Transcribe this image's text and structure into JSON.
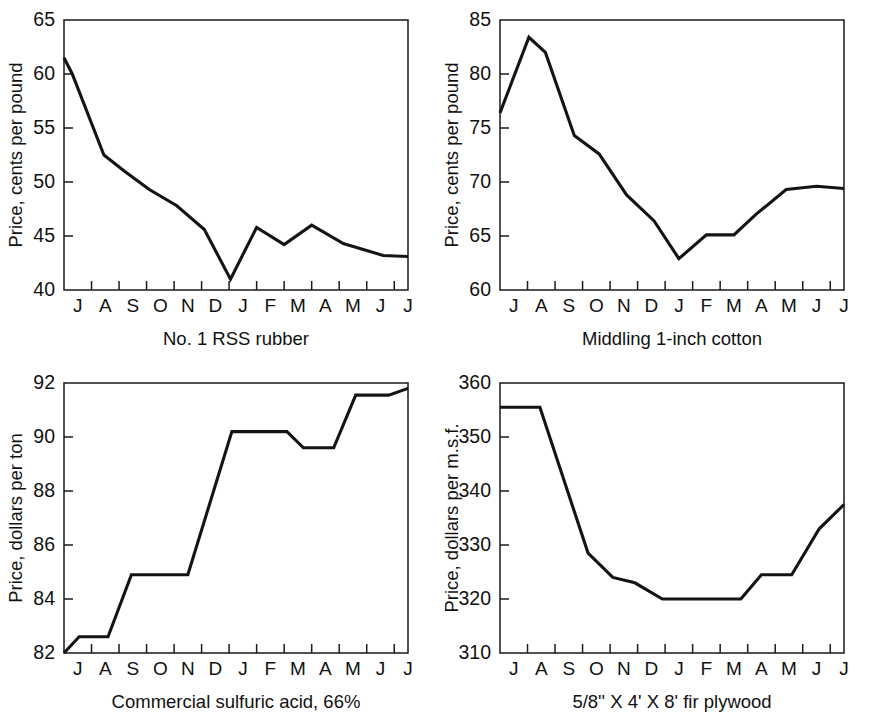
{
  "figure": {
    "panel_count": 4,
    "line_color": "#141414",
    "axis_color": "#1a1a1a",
    "background_color": "#ffffff"
  },
  "chart_data": [
    {
      "id": "rubber",
      "type": "line",
      "title": "",
      "caption": "No. 1 RSS rubber",
      "xlabel": "",
      "ylabel": "Price, cents per pound",
      "categories": [
        "J",
        "A",
        "S",
        "O",
        "N",
        "D",
        "J",
        "F",
        "M",
        "A",
        "M",
        "J",
        "J"
      ],
      "x_tick_labels": [
        "J",
        "A",
        "S",
        "O",
        "N",
        "D",
        "J",
        "F",
        "M",
        "A",
        "M",
        "J",
        "J"
      ],
      "y_tick_labels": [
        "40",
        "45",
        "50",
        "55",
        "60",
        "65"
      ],
      "y_ticks": [
        40,
        45,
        50,
        55,
        60,
        65
      ],
      "ylim": [
        40,
        65
      ],
      "values": [
        61.5,
        60.0,
        52.5,
        51.0,
        49.3,
        47.8,
        45.6,
        41.0,
        45.8,
        44.2,
        46.0,
        44.3,
        43.2,
        43.1
      ],
      "x_points": [
        0,
        0.3,
        1.45,
        2.2,
        3.1,
        4.1,
        5.1,
        6.05,
        7.0,
        8.0,
        9.0,
        10.15,
        11.6,
        12.5
      ],
      "grid": false,
      "legend": "none"
    },
    {
      "id": "cotton",
      "type": "line",
      "title": "",
      "caption": "Middling 1-inch cotton",
      "xlabel": "",
      "ylabel": "Price, cents per pound",
      "categories": [
        "J",
        "A",
        "S",
        "O",
        "N",
        "D",
        "J",
        "F",
        "M",
        "A",
        "M",
        "J",
        "J"
      ],
      "x_tick_labels": [
        "J",
        "A",
        "S",
        "O",
        "N",
        "D",
        "J",
        "F",
        "M",
        "A",
        "M",
        "J",
        "J"
      ],
      "y_tick_labels": [
        "60",
        "65",
        "70",
        "75",
        "80",
        "85"
      ],
      "y_ticks": [
        60,
        65,
        70,
        75,
        80,
        85
      ],
      "ylim": [
        60,
        85
      ],
      "values": [
        76.4,
        83.4,
        82.0,
        74.3,
        72.6,
        68.8,
        66.4,
        62.9,
        65.1,
        65.1,
        67.0,
        69.3,
        69.6,
        69.4
      ],
      "x_points": [
        0,
        1.05,
        1.65,
        2.7,
        3.6,
        4.6,
        5.6,
        6.5,
        7.5,
        8.5,
        9.3,
        10.4,
        11.5,
        12.5
      ],
      "grid": false,
      "legend": "none"
    },
    {
      "id": "sulfuric-acid",
      "type": "line",
      "title": "",
      "caption": "Commercial sulfuric acid, 66%",
      "xlabel": "",
      "ylabel": "Price, dollars per ton",
      "categories": [
        "J",
        "A",
        "S",
        "O",
        "N",
        "D",
        "J",
        "F",
        "M",
        "A",
        "M",
        "J",
        "J"
      ],
      "x_tick_labels": [
        "J",
        "A",
        "S",
        "O",
        "N",
        "D",
        "J",
        "F",
        "M",
        "A",
        "M",
        "J",
        "J"
      ],
      "y_tick_labels": [
        "82",
        "84",
        "86",
        "88",
        "90",
        "92"
      ],
      "y_ticks": [
        82,
        84,
        86,
        88,
        90,
        92
      ],
      "ylim": [
        82,
        92
      ],
      "values": [
        82.0,
        82.6,
        82.6,
        84.9,
        84.9,
        84.9,
        90.2,
        90.2,
        90.2,
        89.6,
        89.6,
        91.55,
        91.55,
        91.8
      ],
      "x_points": [
        0,
        0.55,
        1.6,
        2.45,
        4.0,
        4.5,
        6.1,
        7.0,
        8.1,
        8.7,
        9.8,
        10.6,
        11.8,
        12.5
      ],
      "grid": false,
      "legend": "none"
    },
    {
      "id": "fir-plywood",
      "type": "line",
      "title": "",
      "caption": "5/8'' X 4' X 8' fir plywood",
      "xlabel": "",
      "ylabel": "Price, dollars per m.s.f.",
      "categories": [
        "J",
        "A",
        "S",
        "O",
        "N",
        "D",
        "J",
        "F",
        "M",
        "A",
        "M",
        "J",
        "J"
      ],
      "x_tick_labels": [
        "J",
        "A",
        "S",
        "O",
        "N",
        "D",
        "J",
        "F",
        "M",
        "A",
        "M",
        "J",
        "J"
      ],
      "y_tick_labels": [
        "310",
        "320",
        "330",
        "340",
        "350",
        "360"
      ],
      "y_ticks": [
        310,
        320,
        330,
        340,
        350,
        360
      ],
      "ylim": [
        310,
        360
      ],
      "values": [
        355.5,
        355.5,
        328.5,
        324.0,
        323.0,
        320.0,
        320.0,
        320.0,
        324.5,
        324.5,
        333.0,
        337.5
      ],
      "x_points": [
        0,
        1.45,
        3.2,
        4.1,
        4.9,
        5.9,
        8.1,
        8.75,
        9.5,
        10.6,
        11.6,
        12.5
      ],
      "grid": false,
      "legend": "none"
    }
  ]
}
